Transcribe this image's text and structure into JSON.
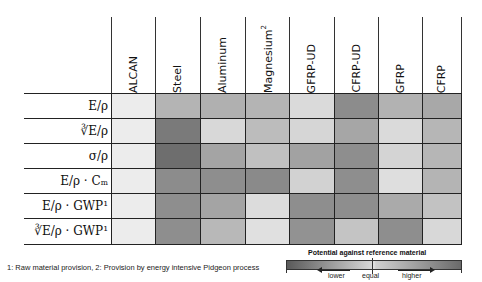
{
  "columns": [
    {
      "label": "ALCAN",
      "sup": ""
    },
    {
      "label": "Steel",
      "sup": ""
    },
    {
      "label": "Aluminum",
      "sup": ""
    },
    {
      "label": "Magnesium",
      "sup": "2"
    },
    {
      "label": "GFRP-UD",
      "sup": ""
    },
    {
      "label": "CFRP-UD",
      "sup": ""
    },
    {
      "label": "GFRP",
      "sup": ""
    },
    {
      "label": "CFRP",
      "sup": ""
    }
  ],
  "rows": [
    {
      "label": "E/ρ",
      "cells": [
        "#ececec",
        "#b4b4b4",
        "#b0b0b0",
        "#b4b4b4",
        "#dadada",
        "#8c8c8c",
        "#b2b2b2",
        "#a8a8a8"
      ]
    },
    {
      "label": "∛E/ρ",
      "cells": [
        "#ececec",
        "#7a7a7a",
        "#d8d8d8",
        "#bcbcbc",
        "#d6d6d6",
        "#a6a6a6",
        "#dadada",
        "#b6b6b6"
      ]
    },
    {
      "label": "σ/ρ",
      "cells": [
        "#ececec",
        "#6e6e6e",
        "#a4a4a4",
        "#c0c0c0",
        "#a2a2a2",
        "#8e8e8e",
        "#d4d4d4",
        "#b6b6b6"
      ]
    },
    {
      "label": "E/ρ · Cₘ",
      "cells": [
        "#ececec",
        "#8c8c8c",
        "#8e8e8e",
        "#8a8a8a",
        "#d2d2d2",
        "#8e8e8e",
        "#dedede",
        "#b4b4b4"
      ]
    },
    {
      "label": "E/ρ · GWP¹",
      "cells": [
        "#ececec",
        "#8e8e8e",
        "#a4a4a4",
        "#dcdcdc",
        "#8e8e8e",
        "#8e8e8e",
        "#aaaaaa",
        "#c2c2c2"
      ]
    },
    {
      "label": "∛E/ρ · GWP¹",
      "cells": [
        "#ececec",
        "#8e8e8e",
        "#b8b8b8",
        "#e0e0e0",
        "#929292",
        "#c4c4c4",
        "#8e8e8e",
        "#d8d8d8"
      ]
    }
  ],
  "footnote": "1: Raw material provision, 2: Provision by energy intensive Pidgeon process",
  "legend": {
    "title": "Potential against reference material",
    "lower": "lower",
    "equal": "equal",
    "higher": "higher"
  }
}
